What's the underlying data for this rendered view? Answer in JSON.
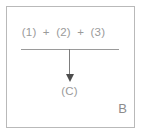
{
  "figure": {
    "panel_label": "B",
    "frame_color": "#b9b9b9",
    "text_color": "#9a9a9a",
    "arrow_color": "#4d4d4d",
    "background": "#ffffff"
  },
  "equation": {
    "numerator": {
      "term_1": "(1)",
      "operator_1": "+",
      "term_2": "(2)",
      "operator_2": "+",
      "term_3": "(3)"
    },
    "result": "(C)"
  }
}
